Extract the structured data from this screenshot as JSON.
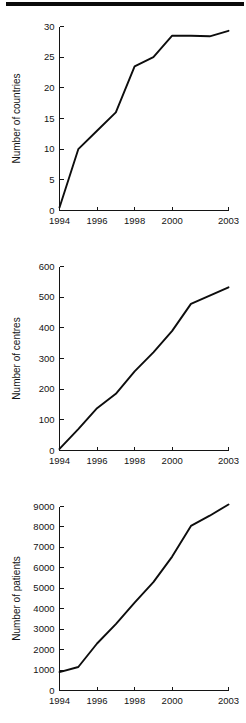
{
  "figure": {
    "background_color": "#ffffff",
    "line_color": "#0d0d0d",
    "axis_color": "#141414",
    "top_rule_color": "#0a0a0a"
  },
  "chart_data": [
    {
      "type": "line",
      "title": "",
      "xlabel": "",
      "ylabel": "Number of countries",
      "x": [
        1994,
        1995,
        1996,
        1997,
        1998,
        1999,
        2000,
        2001,
        2002,
        2003
      ],
      "values": [
        0.5,
        10,
        13,
        16,
        23.5,
        25,
        28.5,
        28.5,
        28.4,
        29.3
      ],
      "xlim": [
        1994,
        2003
      ],
      "ylim": [
        0,
        30
      ],
      "xticks": [
        1994,
        1996,
        1998,
        2000,
        2003
      ],
      "xticklabels": [
        "1994",
        "1996",
        "1998",
        "2000",
        "2003"
      ],
      "yticks": [
        0,
        5,
        10,
        15,
        20,
        25,
        30
      ],
      "yticklabels": [
        "0",
        "5",
        "10",
        "15",
        "20",
        "25",
        "30"
      ],
      "grid": false,
      "legend": "none"
    },
    {
      "type": "line",
      "title": "",
      "xlabel": "",
      "ylabel": "Number of centres",
      "x": [
        1994,
        1995,
        1996,
        1997,
        1998,
        1999,
        2000,
        2001,
        2002,
        2003
      ],
      "values": [
        5,
        70,
        138,
        185,
        258,
        320,
        390,
        478,
        505,
        532
      ],
      "xlim": [
        1994,
        2003
      ],
      "ylim": [
        0,
        600
      ],
      "xticks": [
        1994,
        1996,
        1998,
        2000,
        2003
      ],
      "xticklabels": [
        "1994",
        "1996",
        "1998",
        "2000",
        "2003"
      ],
      "yticks": [
        0,
        100,
        200,
        300,
        400,
        500,
        600
      ],
      "yticklabels": [
        "0",
        "100",
        "200",
        "300",
        "400",
        "500",
        "600"
      ],
      "grid": false,
      "legend": "none"
    },
    {
      "type": "line",
      "title": "",
      "xlabel": "",
      "ylabel": "Number of patients",
      "x": [
        1994,
        1995,
        1996,
        1997,
        1998,
        1999,
        2000,
        2001,
        2002,
        2003
      ],
      "values": [
        900,
        1150,
        2300,
        3250,
        4300,
        5300,
        6550,
        8050,
        8550,
        9100
      ],
      "xlim": [
        1994,
        2003
      ],
      "ylim": [
        0,
        9000
      ],
      "xticks": [
        1994,
        1996,
        1998,
        2000,
        2003
      ],
      "xticklabels": [
        "1994",
        "1996",
        "1998",
        "2000",
        "2003"
      ],
      "yticks": [
        0,
        1000,
        2000,
        3000,
        4000,
        5000,
        6000,
        7000,
        8000,
        9000
      ],
      "yticklabels": [
        "0",
        "1000",
        "2000",
        "3000",
        "4000",
        "5000",
        "6000",
        "7000",
        "8000",
        "9000"
      ],
      "grid": false,
      "legend": "none"
    }
  ]
}
